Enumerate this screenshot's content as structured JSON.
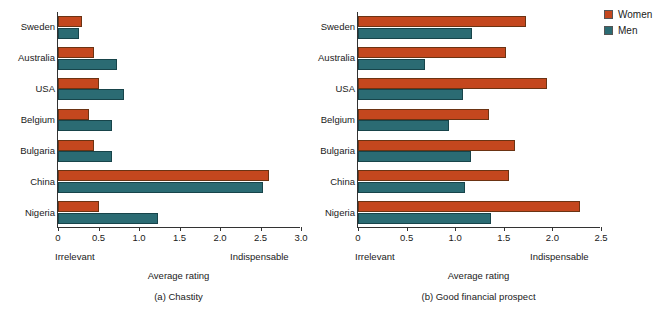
{
  "figure": {
    "legend": {
      "position": "top-right",
      "entries": [
        {
          "label": "Women",
          "color": "#C4471E"
        },
        {
          "label": "Men",
          "color": "#2B6B73"
        }
      ]
    }
  },
  "chart_data": [
    {
      "type": "bar",
      "orientation": "horizontal",
      "panel_id": "a",
      "title": "(a) Chastity",
      "xlabel": "Average rating",
      "ylabel": "",
      "xlim": [
        0,
        3.0
      ],
      "xticks": [
        0,
        0.5,
        1.0,
        1.5,
        2.0,
        2.5,
        3.0
      ],
      "xticklabels": [
        "0",
        "0.5",
        "1.0",
        "1.5",
        "2.0",
        "2.5",
        "3.0"
      ],
      "axis_anchor_low": "Irrelevant",
      "axis_anchor_high": "Indispensable",
      "grid": false,
      "categories": [
        "Sweden",
        "Australia",
        "USA",
        "Belgium",
        "Bulgaria",
        "China",
        "Nigeria"
      ],
      "series": [
        {
          "name": "Women",
          "color": "#C4471E",
          "values": [
            0.3,
            0.45,
            0.5,
            0.38,
            0.44,
            2.6,
            0.5
          ]
        },
        {
          "name": "Men",
          "color": "#2B6B73",
          "values": [
            0.26,
            0.73,
            0.82,
            0.67,
            0.67,
            2.53,
            1.24
          ]
        }
      ]
    },
    {
      "type": "bar",
      "orientation": "horizontal",
      "panel_id": "b",
      "title": "(b) Good financial prospect",
      "xlabel": "Average rating",
      "ylabel": "",
      "xlim": [
        0,
        2.5
      ],
      "xticks": [
        0,
        0.5,
        1.0,
        1.5,
        2.0,
        2.5
      ],
      "xticklabels": [
        "0",
        "0.5",
        "1.0",
        "1.5",
        "2.0",
        "2.5"
      ],
      "axis_anchor_low": "Irrelevant",
      "axis_anchor_high": "Indispensable",
      "grid": false,
      "categories": [
        "Sweden",
        "Australia",
        "USA",
        "Belgium",
        "Bulgaria",
        "China",
        "Nigeria"
      ],
      "series": [
        {
          "name": "Women",
          "color": "#C4471E",
          "values": [
            1.73,
            1.52,
            1.94,
            1.35,
            1.62,
            1.55,
            2.28
          ]
        },
        {
          "name": "Men",
          "color": "#2B6B73",
          "values": [
            1.17,
            0.69,
            1.08,
            0.94,
            1.16,
            1.1,
            1.37
          ]
        }
      ]
    }
  ]
}
